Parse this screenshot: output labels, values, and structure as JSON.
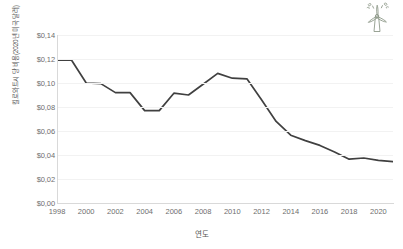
{
  "chart_data": {
    "type": "line",
    "title": "",
    "xlabel": "연도",
    "ylabel": "킬로와트시 당 비용(2020년 미국 달러)",
    "x": [
      1998,
      1999,
      2000,
      2001,
      2002,
      2003,
      2004,
      2005,
      2006,
      2007,
      2008,
      2009,
      2010,
      2011,
      2012,
      2013,
      2014,
      2015,
      2016,
      2017,
      2018,
      2019,
      2020,
      2021
    ],
    "values": [
      0.119,
      0.119,
      0.1,
      0.0995,
      0.092,
      0.092,
      0.077,
      0.077,
      0.0915,
      0.09,
      0.099,
      0.108,
      0.104,
      0.1035,
      0.086,
      0.068,
      0.0565,
      0.052,
      0.048,
      0.0425,
      0.0365,
      0.0375,
      0.0355,
      0.0345
    ],
    "series": [
      {
        "name": "킬로와트시 당 비용",
        "color": "#404040",
        "values": [
          0.119,
          0.119,
          0.1,
          0.0995,
          0.092,
          0.092,
          0.077,
          0.077,
          0.0915,
          0.09,
          0.099,
          0.108,
          0.104,
          0.1035,
          0.086,
          0.068,
          0.0565,
          0.052,
          0.048,
          0.0425,
          0.0365,
          0.0375,
          0.0355,
          0.0345
        ]
      }
    ],
    "xlim": [
      1998,
      2021
    ],
    "ylim": [
      0,
      0.14
    ],
    "ytick_labels": [
      "$0,00",
      "$0,02",
      "$0,04",
      "$0,06",
      "$0,08",
      "$0,10",
      "$0,12",
      "$0,14"
    ],
    "ytick_values": [
      0,
      0.02,
      0.04,
      0.06,
      0.08,
      0.1,
      0.12,
      0.14
    ],
    "xtick_labels": [
      "1998",
      "2000",
      "2002",
      "2004",
      "2006",
      "2008",
      "2010",
      "2012",
      "2014",
      "2016",
      "2018",
      "2020"
    ],
    "xtick_values": [
      1998,
      2000,
      2002,
      2004,
      2006,
      2008,
      2010,
      2012,
      2014,
      2016,
      2018,
      2020
    ],
    "grid": true,
    "grid_axis": "y",
    "legend": false,
    "legend_position": "none",
    "decimal_separator": ",",
    "currency_symbol": "$",
    "line_color": "#404040",
    "grid_color": "#f2f2f2",
    "axis_color": "#d9d9d9",
    "tick_label_color": "#6e6e6e",
    "background_color": "#ffffff"
  },
  "decoration": {
    "turbine_icon_name": "wind-turbine-icon",
    "turbine_icon_color": "#8f9a8a"
  }
}
